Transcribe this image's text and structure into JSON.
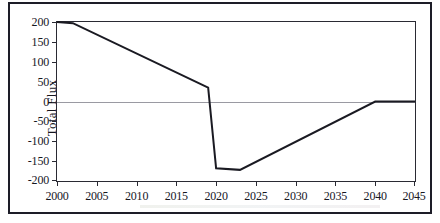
{
  "figure": {
    "cut_caption": "",
    "background_color": "#ffffff",
    "border_color": "#1d1d28"
  },
  "axis": {
    "y_title": "Total Flux",
    "y_ticks": [
      "200",
      "150",
      "100",
      "50",
      "0",
      "-50",
      "-100",
      "-150",
      "-200"
    ],
    "x_ticks": [
      "2000",
      "2005",
      "2010",
      "2015",
      "2020",
      "2025",
      "2030",
      "2035",
      "2040",
      "2045"
    ]
  },
  "chart_data": {
    "type": "line",
    "title": "",
    "subtitle": "",
    "xlabel": "",
    "ylabel": "Total Flux",
    "xlim": [
      2000,
      2045
    ],
    "ylim": [
      -200,
      200
    ],
    "xticks": [
      2000,
      2005,
      2010,
      2015,
      2020,
      2025,
      2030,
      2035,
      2040,
      2045
    ],
    "yticks": [
      -200,
      -150,
      -100,
      -50,
      0,
      50,
      100,
      150,
      200
    ],
    "grid": false,
    "zero_line": true,
    "zero_line_color": "#9a9aa2",
    "legend": null,
    "series": [
      {
        "name": "Total Flux",
        "color": "#1a1a22",
        "line_width": 2,
        "x": [
          2000,
          2002,
          2019,
          2020,
          2023,
          2040,
          2045
        ],
        "y": [
          200,
          197,
          35,
          -168,
          -172,
          0,
          0
        ]
      }
    ],
    "annotations": [
      "Flux holds near 200 until 2002",
      "Steady linear decline from 2002 to 2019 reaching about 35",
      "Sharp collapse in 2020 to about -168",
      "Flat trough through 2023 at about -172",
      "Linear recovery to 0 by 2040",
      "Flat at 0 from 2040 to 2045"
    ]
  }
}
